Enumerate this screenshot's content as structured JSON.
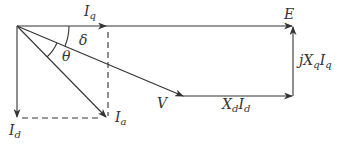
{
  "diagram": {
    "type": "phasor-diagram",
    "title": "",
    "colors": {
      "line": "#333333",
      "background": "#ffffff"
    },
    "labels": {
      "Iq": {
        "base": "I",
        "sub": "q"
      },
      "E": {
        "base": "E"
      },
      "delta": "δ",
      "theta": "θ",
      "V": {
        "base": "V"
      },
      "XdId": {
        "base1": "X",
        "sub1": "d",
        "base2": "I",
        "sub2": "d"
      },
      "jXqIq": {
        "pre": "j",
        "base1": "X",
        "sub1": "q",
        "base2": "I",
        "sub2": "q"
      },
      "Id": {
        "base": "I",
        "sub": "d"
      },
      "Ia": {
        "base": "I",
        "sub": "a"
      }
    },
    "vectors": [
      {
        "name": "I_q",
        "from": [
          17,
          26
        ],
        "to": [
          106,
          26
        ],
        "style": "solid"
      },
      {
        "name": "E",
        "from": [
          106,
          26
        ],
        "to": [
          293,
          26
        ],
        "style": "solid"
      },
      {
        "name": "V",
        "from": [
          17,
          26
        ],
        "to": [
          183,
          96
        ],
        "style": "solid"
      },
      {
        "name": "X_d I_d",
        "from": [
          183,
          96
        ],
        "to": [
          293,
          96
        ],
        "style": "solid"
      },
      {
        "name": "jX_q I_q",
        "from": [
          293,
          96
        ],
        "to": [
          293,
          26
        ],
        "style": "solid"
      },
      {
        "name": "I_d",
        "from": [
          17,
          26
        ],
        "to": [
          17,
          118
        ],
        "style": "solid"
      },
      {
        "name": "I_a",
        "from": [
          17,
          26
        ],
        "to": [
          107,
          118
        ],
        "style": "solid"
      }
    ],
    "dashed_lines": [
      {
        "from": [
          108,
          32
        ],
        "to": [
          108,
          118
        ]
      },
      {
        "from": [
          22,
          118
        ],
        "to": [
          100,
          118
        ]
      }
    ],
    "angles": [
      {
        "name": "delta",
        "between": [
          "I_q",
          "V"
        ]
      },
      {
        "name": "theta",
        "between": [
          "V",
          "I_a"
        ]
      }
    ]
  }
}
